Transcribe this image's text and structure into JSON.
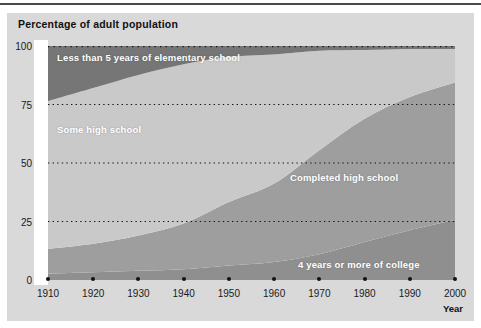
{
  "chart_data": {
    "type": "area",
    "title": "Percentage of adult population",
    "xlabel": "Year",
    "ylabel": "Percentage of adult population",
    "xlim": [
      1910,
      2000
    ],
    "ylim": [
      0,
      100
    ],
    "grid": "horizontal-dotted",
    "legend_position": "inline-labels",
    "stacked": true,
    "stack_total": 100,
    "x": [
      1910,
      1920,
      1930,
      1940,
      1950,
      1960,
      1970,
      1980,
      1990,
      2000
    ],
    "xtick_labels": [
      "1910",
      "1920",
      "1930",
      "1940",
      "1950",
      "1960",
      "1970",
      "1980",
      "1990",
      "2000"
    ],
    "ytick_labels": [
      "0",
      "25",
      "50",
      "75",
      "100"
    ],
    "ytick_values": [
      0,
      25,
      50,
      75,
      100
    ],
    "series": [
      {
        "name": "4 years or more of college",
        "color": "#8f8f8f",
        "values": [
          2.7,
          3.3,
          3.9,
          4.6,
          6.2,
          7.7,
          11.0,
          16.2,
          21.3,
          25.6
        ]
      },
      {
        "name": "Completed high school",
        "color": "#9e9e9e",
        "values": [
          10.6,
          12.2,
          15.1,
          19.5,
          27.1,
          33.5,
          44.5,
          52.7,
          56.9,
          58.8
        ]
      },
      {
        "name": "Some high school",
        "color": "#c9c9c9",
        "values": [
          63.1,
          66.5,
          68.6,
          68.1,
          62.1,
          55.2,
          42.5,
          29.4,
          20.5,
          14.3
        ]
      },
      {
        "name": "Less than 5 years of elementary school",
        "color": "#767676",
        "values": [
          23.6,
          18.0,
          12.4,
          7.8,
          4.6,
          3.6,
          2.0,
          1.7,
          1.3,
          1.3
        ]
      }
    ],
    "annotations": [
      {
        "text": "Less than 5 years of elementary school",
        "x": 1911.5,
        "y": 96
      },
      {
        "text": "Some high school",
        "x": 1911.5,
        "y": 70
      },
      {
        "text": "Completed high school",
        "x": 1964.5,
        "y": 45
      },
      {
        "text": "4 years or more of college",
        "x": 1966.5,
        "y": 7
      }
    ]
  },
  "colors": {
    "page_background": "#ffffff",
    "card_background": "#d9d9d9",
    "plot_background": "#ffffff",
    "top_rule": "#4a4a4a",
    "gridline": "#141414",
    "tick_dot": "#111111",
    "axis_text": "#1a1a1a",
    "label_text": "#ffffff",
    "title_text": "#111111"
  }
}
